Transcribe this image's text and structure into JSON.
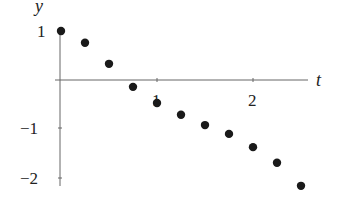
{
  "chart_data": {
    "type": "scatter",
    "title": "",
    "xlabel": "t",
    "ylabel": "y",
    "xlim": [
      0,
      2.6
    ],
    "ylim": [
      -2.2,
      1.1
    ],
    "x_ticks": [
      1,
      2
    ],
    "x_tick_labels": [
      "1",
      "2"
    ],
    "y_ticks": [
      1,
      -1,
      -2
    ],
    "y_tick_labels": [
      "1",
      "−1",
      "−2"
    ],
    "grid": false,
    "legend": null,
    "series": [
      {
        "name": "points",
        "x": [
          0,
          0.25,
          0.5,
          0.75,
          1.0,
          1.25,
          1.5,
          1.75,
          2.0,
          2.25,
          2.5
        ],
        "y": [
          1.0,
          0.76,
          0.33,
          -0.14,
          -0.47,
          -0.71,
          -0.92,
          -1.1,
          -1.37,
          -1.69,
          -2.16
        ]
      }
    ],
    "colors": {
      "points": "#1a1a1a",
      "axes": "#555555"
    }
  },
  "axes": {
    "x_label": "t",
    "y_label": "y",
    "tick_1": "1",
    "tick_2": "2",
    "tick_y1": "1",
    "tick_ym1": "−1",
    "tick_ym2": "−2"
  }
}
